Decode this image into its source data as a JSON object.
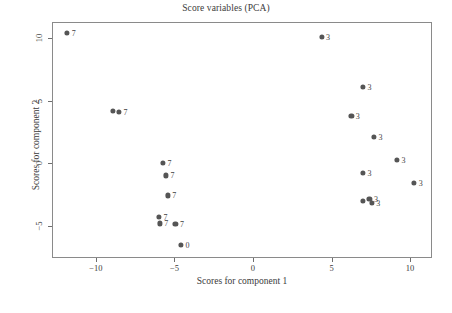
{
  "chart_data": {
    "type": "scatter",
    "title": "Score variables (PCA)",
    "xlabel": "Scores for component 1",
    "ylabel": "Scores for component 2",
    "xlim": [
      -12.8,
      11.4
    ],
    "ylim": [
      -7.6,
      11.3
    ],
    "xticks": [
      -10,
      -5,
      0,
      5,
      10
    ],
    "xticklabels": [
      "−10",
      "−5",
      "0",
      "5",
      "10"
    ],
    "yticks": [
      10,
      5,
      0,
      -5
    ],
    "yticklabels": [
      "10",
      "5",
      "0",
      "−5"
    ],
    "grid": false,
    "legend": false,
    "marker_color": "#555555",
    "points": [
      {
        "x": -11.9,
        "y": 10.5,
        "label": "7"
      },
      {
        "x": -9.0,
        "y": 4.25,
        "label": ""
      },
      {
        "x": -8.6,
        "y": 4.2,
        "label": "7"
      },
      {
        "x": -5.8,
        "y": 0.1,
        "label": "7"
      },
      {
        "x": -5.6,
        "y": -0.9,
        "label": "7"
      },
      {
        "x": -5.5,
        "y": -2.5,
        "label": "7"
      },
      {
        "x": -6.05,
        "y": -4.2,
        "label": "7"
      },
      {
        "x": -6.0,
        "y": -4.75,
        "label": "7"
      },
      {
        "x": -5.0,
        "y": -4.8,
        "label": "7"
      },
      {
        "x": -4.65,
        "y": -6.5,
        "label": "0"
      },
      {
        "x": 4.3,
        "y": 10.2,
        "label": "3"
      },
      {
        "x": 6.95,
        "y": 6.15,
        "label": "3"
      },
      {
        "x": 6.2,
        "y": 3.85,
        "label": "3"
      },
      {
        "x": 7.65,
        "y": 2.2,
        "label": "3"
      },
      {
        "x": 9.1,
        "y": 0.35,
        "label": "3"
      },
      {
        "x": 6.95,
        "y": -0.7,
        "label": "3"
      },
      {
        "x": 10.2,
        "y": -1.5,
        "label": "3"
      },
      {
        "x": 6.95,
        "y": -2.95,
        "label": ""
      },
      {
        "x": 7.35,
        "y": -2.8,
        "label": "3"
      },
      {
        "x": 7.5,
        "y": -3.1,
        "label": "3"
      }
    ]
  }
}
